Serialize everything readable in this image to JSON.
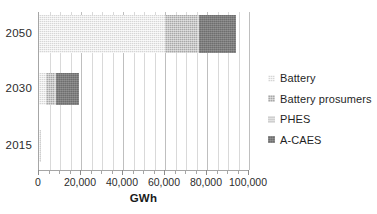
{
  "chart_data": {
    "type": "bar",
    "orientation": "horizontal",
    "stacked": true,
    "title": "",
    "xlabel": "GWh",
    "ylabel": "",
    "xlim": [
      0,
      100000
    ],
    "x_major_ticks": [
      0,
      20000,
      40000,
      60000,
      80000,
      100000
    ],
    "x_tick_labels": [
      "0",
      "20,000",
      "40,000",
      "60,000",
      "80,000",
      "100,000"
    ],
    "x_minor_tick_interval": 5000,
    "grid": "vertical",
    "legend_position": "right",
    "categories": [
      "2050",
      "2030",
      "2015"
    ],
    "series": [
      {
        "name": "Battery",
        "color": "#d6d6d6",
        "values": [
          60000,
          3500,
          300
        ]
      },
      {
        "name": "Battery prosumers",
        "color": "#a8a8a8",
        "values": [
          15000,
          3500,
          0
        ]
      },
      {
        "name": "PHES",
        "color": "#cfcfcf",
        "values": [
          1000,
          1000,
          200
        ]
      },
      {
        "name": "A-CAES",
        "color": "#6e6e6e",
        "values": [
          18000,
          11000,
          0
        ]
      }
    ],
    "totals": [
      94000,
      19000,
      500
    ]
  },
  "axis": {
    "x_title": "GWh",
    "tick_labels": [
      "0",
      "20,000",
      "40,000",
      "60,000",
      "80,000",
      "100,000"
    ]
  },
  "categories": [
    {
      "label": "2050"
    },
    {
      "label": "2030"
    },
    {
      "label": "2015"
    }
  ],
  "legend": {
    "items": [
      {
        "label": "Battery",
        "color": "#d6d6d6"
      },
      {
        "label": "Battery prosumers",
        "color": "#a8a8a8"
      },
      {
        "label": "PHES",
        "color": "#cfcfcf"
      },
      {
        "label": "A-CAES",
        "color": "#6e6e6e"
      }
    ]
  }
}
